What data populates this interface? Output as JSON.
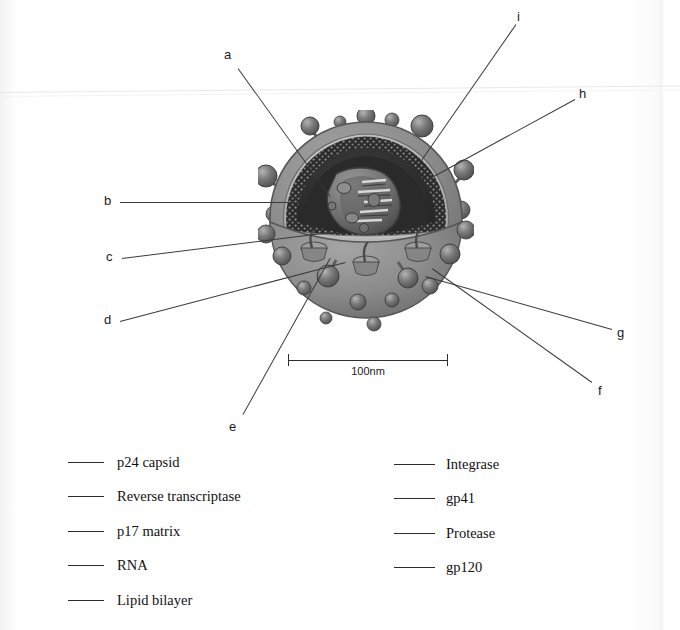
{
  "figure": {
    "scale_bar": {
      "label": "100nm"
    }
  },
  "callouts": [
    {
      "letter": "a",
      "x": 224,
      "y": 48,
      "line": {
        "x1": 238,
        "y1": 68,
        "x2": 330,
        "y2": 196
      }
    },
    {
      "letter": "b",
      "x": 104,
      "y": 194,
      "line": {
        "x1": 120,
        "y1": 202,
        "x2": 300,
        "y2": 202
      }
    },
    {
      "letter": "c",
      "x": 106,
      "y": 250,
      "line": {
        "x1": 122,
        "y1": 258,
        "x2": 330,
        "y2": 232
      }
    },
    {
      "letter": "d",
      "x": 104,
      "y": 313,
      "line": {
        "x1": 120,
        "y1": 321,
        "x2": 345,
        "y2": 262
      }
    },
    {
      "letter": "e",
      "x": 229,
      "y": 420,
      "line": {
        "x1": 243,
        "y1": 414,
        "x2": 330,
        "y2": 258
      }
    },
    {
      "letter": "f",
      "x": 598,
      "y": 384,
      "line": {
        "x1": 592,
        "y1": 382,
        "x2": 432,
        "y2": 268
      }
    },
    {
      "letter": "g",
      "x": 617,
      "y": 326,
      "line": {
        "x1": 612,
        "y1": 329,
        "x2": 425,
        "y2": 276
      }
    },
    {
      "letter": "h",
      "x": 579,
      "y": 87,
      "line": {
        "x1": 575,
        "y1": 99,
        "x2": 430,
        "y2": 178
      }
    },
    {
      "letter": "i",
      "x": 517,
      "y": 10,
      "line": {
        "x1": 516,
        "y1": 24,
        "x2": 420,
        "y2": 162
      }
    }
  ],
  "legend": {
    "left_column": [
      {
        "label": "p24 capsid"
      },
      {
        "label": "Reverse transcriptase"
      },
      {
        "label": "p17 matrix"
      },
      {
        "label": "RNA"
      },
      {
        "label": "Lipid bilayer"
      }
    ],
    "right_column": [
      {
        "label": "Integrase"
      },
      {
        "label": "gp41"
      },
      {
        "label": "Protease"
      },
      {
        "label": "gp120"
      }
    ]
  },
  "colors": {
    "page_background": "#ffffff",
    "line": "#3a3a3a",
    "text": "#111111",
    "envelope_outer": "#8d8d8d",
    "envelope_rim": "#6f6f6f",
    "matrix_band": "#b9b9b9",
    "capsid_interior": "#2e2e2e",
    "knob": "#6a6a6a",
    "knob_highlight": "#a8a8a8",
    "core_cone": "#787878"
  },
  "structure_parts": [
    {
      "name": "gp120-knob"
    },
    {
      "name": "gp41-stalk"
    },
    {
      "name": "lipid-bilayer-envelope"
    },
    {
      "name": "p17-matrix-layer"
    },
    {
      "name": "p24-capsid-cone"
    },
    {
      "name": "rna-strand"
    },
    {
      "name": "reverse-transcriptase"
    },
    {
      "name": "integrase"
    },
    {
      "name": "protease"
    }
  ]
}
